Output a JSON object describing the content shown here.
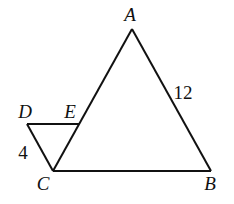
{
  "figure": {
    "type": "geometry",
    "points": {
      "A": {
        "label": "A",
        "x": 132,
        "y": 29,
        "label_x": 130,
        "label_y": 21
      },
      "B": {
        "label": "B",
        "x": 211,
        "y": 171,
        "label_x": 210,
        "label_y": 190
      },
      "C": {
        "label": "C",
        "x": 53,
        "y": 171,
        "label_x": 43,
        "label_y": 190
      },
      "D": {
        "label": "D",
        "x": 27,
        "y": 124,
        "label_x": 25,
        "label_y": 118
      },
      "E": {
        "label": "E",
        "x": 79,
        "y": 124,
        "label_x": 70,
        "label_y": 118
      }
    },
    "segments": [
      {
        "id": "AB",
        "from": "A",
        "to": "B"
      },
      {
        "id": "BC",
        "from": "B",
        "to": "C"
      },
      {
        "id": "CA",
        "from": "C",
        "to": "A"
      },
      {
        "id": "DE",
        "from": "D",
        "to": "E"
      },
      {
        "id": "DC",
        "from": "D",
        "to": "C"
      }
    ],
    "measures": [
      {
        "segment": "AB",
        "text": "12",
        "x": 183,
        "y": 99
      },
      {
        "segment": "DC",
        "text": "4",
        "x": 23,
        "y": 159
      }
    ],
    "stroke_color": "#111111",
    "background": "#ffffff"
  }
}
